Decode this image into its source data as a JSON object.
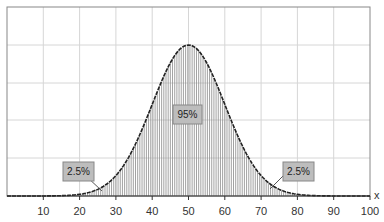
{
  "chart_data": {
    "type": "area",
    "title": "",
    "xlabel": "x",
    "ylabel": "",
    "xlim": [
      0,
      100
    ],
    "x_ticks": [
      10,
      20,
      30,
      40,
      50,
      60,
      70,
      80,
      90,
      100
    ],
    "grid": true,
    "distribution": {
      "name": "normal",
      "mean": 50,
      "sd": 10
    },
    "shaded_region": [
      30,
      70
    ],
    "annotations": [
      {
        "text": "95%",
        "x": 50,
        "region": "center"
      },
      {
        "text": "2.5%",
        "x": 25,
        "region": "left-tail"
      },
      {
        "text": "2.5%",
        "x": 75,
        "region": "right-tail"
      }
    ],
    "legend": null
  },
  "axis": {
    "x_label": "x",
    "ticks": [
      "10",
      "20",
      "30",
      "40",
      "50",
      "60",
      "70",
      "80",
      "90",
      "100"
    ]
  },
  "labels": {
    "center": "95%",
    "left_tail": "2.5%",
    "right_tail": "2.5%"
  }
}
